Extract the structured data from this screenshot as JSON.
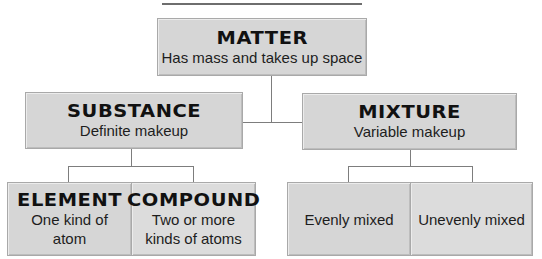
{
  "title": {
    "text": "Classifying Matter"
  },
  "colors": {
    "box_fill": "#d6d6d6",
    "box_border": "#a9a9a9",
    "connector": "#7d7d7d",
    "text": "#1a1a1a"
  },
  "nodes": {
    "matter": {
      "heading": "MATTER",
      "description": "Has mass and takes up space"
    },
    "substance": {
      "heading": "SUBSTANCE",
      "description": "Definite makeup"
    },
    "mixture": {
      "heading": "MIXTURE",
      "description": "Variable makeup"
    },
    "element": {
      "heading": "ELEMENT",
      "description_line1": "One kind of",
      "description_line2": "atom"
    },
    "compound": {
      "heading": "COMPOUND",
      "description_line1": "Two or more",
      "description_line2": "kinds of atoms"
    },
    "evenly_mixed": {
      "description": "Evenly mixed"
    },
    "unevenly_mixed": {
      "description": "Unevenly mixed"
    }
  },
  "edges": [
    {
      "from": "MATTER",
      "to": "SUBSTANCE"
    },
    {
      "from": "MATTER",
      "to": "MIXTURE"
    },
    {
      "from": "SUBSTANCE",
      "to": "ELEMENT"
    },
    {
      "from": "SUBSTANCE",
      "to": "COMPOUND"
    },
    {
      "from": "MIXTURE",
      "to": "Evenly mixed"
    },
    {
      "from": "MIXTURE",
      "to": "Unevenly mixed"
    }
  ]
}
